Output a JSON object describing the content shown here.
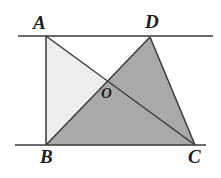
{
  "figure": {
    "name": "geometry-figure",
    "canvas": {
      "width": 221,
      "height": 178
    },
    "colors": {
      "background": "#ffffff",
      "stroke": "#3a3a3a",
      "light_fill": "#ededed",
      "dark_fill": "#a9a9a9",
      "label": "#1c1c1c"
    },
    "points": {
      "A": {
        "label": "A",
        "x": 46,
        "y": 36
      },
      "D": {
        "label": "D",
        "x": 150,
        "y": 37
      },
      "B": {
        "label": "B",
        "x": 46,
        "y": 145
      },
      "C": {
        "label": "C",
        "x": 195,
        "y": 145
      },
      "O": {
        "label": "O",
        "x": 105,
        "y": 81
      }
    },
    "lines": [
      {
        "name": "top-parallel-line",
        "from_x": 18,
        "from_y": 36,
        "to_x": 213,
        "to_y": 36
      },
      {
        "name": "bottom-parallel-line",
        "from_x": 15,
        "from_y": 145,
        "to_x": 206,
        "to_y": 145
      }
    ],
    "segments": [
      {
        "name": "segment-AB",
        "from": "A",
        "to": "B"
      },
      {
        "name": "segment-AC",
        "from": "A",
        "to": "C"
      },
      {
        "name": "segment-DB",
        "from": "D",
        "to": "B"
      },
      {
        "name": "segment-DC",
        "from": "D",
        "to": "C"
      }
    ],
    "regions": [
      {
        "name": "triangle-ABO",
        "vertices": "A B O",
        "fill": "light"
      },
      {
        "name": "triangle-DBC",
        "vertices": "D B C",
        "fill": "dark"
      }
    ],
    "labels": {
      "A": "A",
      "D": "D",
      "B": "B",
      "C": "C",
      "O": "O"
    }
  }
}
